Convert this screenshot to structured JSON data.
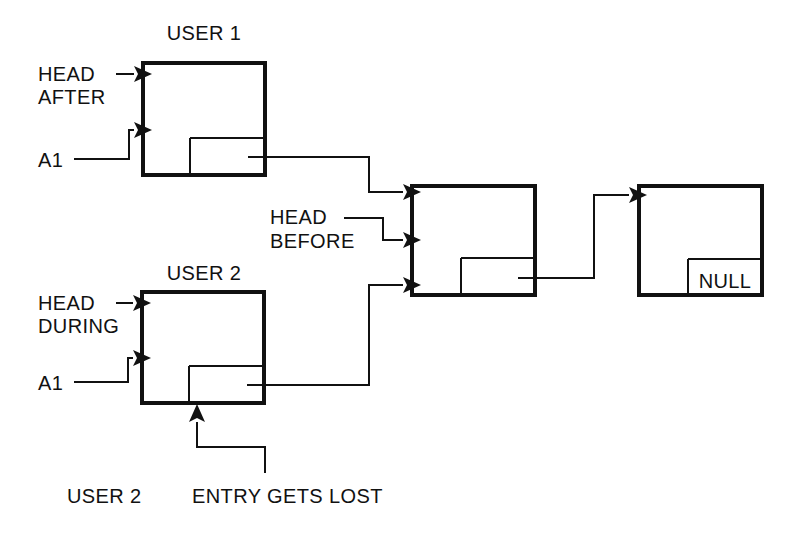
{
  "diagram": {
    "background_color": "#ffffff",
    "line_color": "#111111",
    "labels": {
      "user1_title": "USER 1",
      "user2_title": "USER 2",
      "head_after_line1": "HEAD",
      "head_after_line2": "AFTER",
      "head_during_line1": "HEAD",
      "head_during_line2": "DURING",
      "head_before_line1": "HEAD",
      "head_before_line2": "BEFORE",
      "a1_top": "A1",
      "a1_bottom": "A1",
      "null_value": "NULL",
      "footer_user2": "USER 2",
      "footer_entry_lost": "ENTRY GETS LOST"
    },
    "nodes": [
      {
        "id": "node-user1",
        "name": "user1-node",
        "outer": {
          "x": 141,
          "y": 61,
          "w": 126,
          "h": 116
        },
        "inner": {
          "x": 190,
          "y": 138,
          "w": 77,
          "h": 39
        },
        "inner_text": ""
      },
      {
        "id": "node-shared",
        "name": "shared-node",
        "outer": {
          "x": 410,
          "y": 184,
          "w": 127,
          "h": 113
        },
        "inner": {
          "x": 460,
          "y": 258,
          "w": 77,
          "h": 39
        },
        "inner_text": ""
      },
      {
        "id": "node-null",
        "name": "tail-node",
        "outer": {
          "x": 637,
          "y": 184,
          "w": 127,
          "h": 113
        },
        "inner": {
          "x": 687,
          "y": 259,
          "w": 77,
          "h": 38
        },
        "inner_text": "NULL"
      },
      {
        "id": "node-user2",
        "name": "user2-node",
        "outer": {
          "x": 140,
          "y": 290,
          "w": 126,
          "h": 115
        },
        "inner": {
          "x": 189,
          "y": 366,
          "w": 77,
          "h": 39
        },
        "inner_text": ""
      }
    ],
    "connections": [
      {
        "name": "head-after-arrow",
        "from": "HEAD AFTER label",
        "to": "user1-node"
      },
      {
        "name": "a1-top-arrow",
        "from": "A1 label",
        "to": "user1-node"
      },
      {
        "name": "user1-next-arrow",
        "from": "user1-node pointer field",
        "to": "shared-node"
      },
      {
        "name": "head-before-arrow",
        "from": "HEAD BEFORE label",
        "to": "shared-node"
      },
      {
        "name": "user2-next-arrow",
        "from": "user2-node pointer field",
        "to": "shared-node"
      },
      {
        "name": "shared-next-arrow",
        "from": "shared-node pointer field",
        "to": "tail-node"
      },
      {
        "name": "head-during-arrow",
        "from": "HEAD DURING label",
        "to": "user2-node"
      },
      {
        "name": "a1-bottom-arrow",
        "from": "A1 label",
        "to": "user2-node"
      },
      {
        "name": "entry-lost-arrow",
        "from": "ENTRY GETS LOST label",
        "to": "user2-node bottom"
      }
    ]
  }
}
